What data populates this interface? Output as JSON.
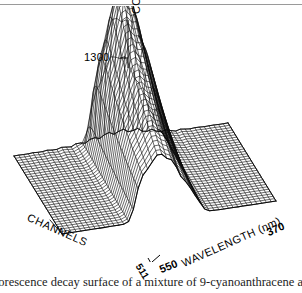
{
  "figure": {
    "type": "3d-wireframe-surface",
    "caption": "uorescence decay surface of a mixture of 9-cyanoanthracene and",
    "axes": {
      "vertical": {
        "label": "COUNTS",
        "ticks": [
          "1300"
        ]
      },
      "left_depth": {
        "label": "CHANNELS",
        "ticks": [
          "511"
        ]
      },
      "right_horizontal": {
        "label": "WAVELENGTH (nm)",
        "ticks": [
          "550",
          "370"
        ]
      }
    }
  },
  "chart_data": {
    "type": "surface",
    "title": "",
    "xlabel": "WAVELENGTH (nm)",
    "ylabel": "CHANNELS",
    "zlabel": "COUNTS",
    "xlim": [
      370,
      550
    ],
    "zlim": [
      0,
      1300
    ],
    "x_tick_labels": [
      "550",
      "370"
    ],
    "y_tick_labels": [
      "511"
    ],
    "z_tick_labels": [
      "1300"
    ],
    "grid": true,
    "legend": false,
    "peaks": [
      {
        "wavelength": 430,
        "channel": 60,
        "counts": 1320
      },
      {
        "wavelength": 445,
        "channel": 62,
        "counts": 1180
      },
      {
        "wavelength": 415,
        "channel": 66,
        "counts": 900
      },
      {
        "wavelength": 460,
        "channel": 70,
        "counts": 760
      },
      {
        "wavelength": 400,
        "channel": 80,
        "counts": 520
      }
    ],
    "baseline_counts": 0
  },
  "colors": {
    "ink": "#000000",
    "paper": "#ffffff",
    "rule": "#9a9a9a",
    "caption_ink": "#1c1c1c"
  }
}
